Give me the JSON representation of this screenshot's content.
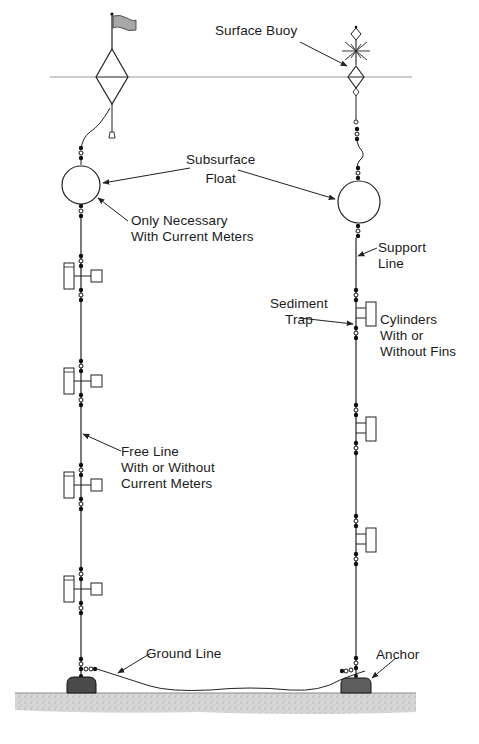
{
  "diagram": {
    "type": "oceanographic-mooring-schematic",
    "colors": {
      "line": "#2a2a2a",
      "flag": "#a8a8a8",
      "anchor": "#5a5a5a",
      "seabed": "#cfcfcf",
      "water_line": "#9a9a9a"
    },
    "labels": {
      "surface_buoy": "Surface Buoy",
      "subsurface_float": [
        "Subsurface",
        "Float"
      ],
      "only_necessary": [
        "Only Necessary",
        "With Current Meters"
      ],
      "support_line": [
        "Support",
        "Line"
      ],
      "sediment_trap": [
        "Sediment",
        "Trap"
      ],
      "cylinders": [
        "Cylinders",
        "With or",
        "Without Fins"
      ],
      "free_line": [
        "Free Line",
        "With or Without",
        "Current Meters"
      ],
      "ground_line": "Ground Line",
      "anchor": "Anchor"
    },
    "left_mooring": {
      "components": [
        "surface-marker-buoy-with-flag",
        "subsurface-float",
        "current-meter",
        "current-meter",
        "current-meter",
        "current-meter",
        "anchor"
      ],
      "current_meter_count": 4
    },
    "right_mooring": {
      "components": [
        "surface-buoy-with-radar-reflector",
        "subsurface-float",
        "sediment-trap",
        "sediment-trap",
        "sediment-trap",
        "anchor"
      ],
      "sediment_trap_count": 3
    }
  }
}
